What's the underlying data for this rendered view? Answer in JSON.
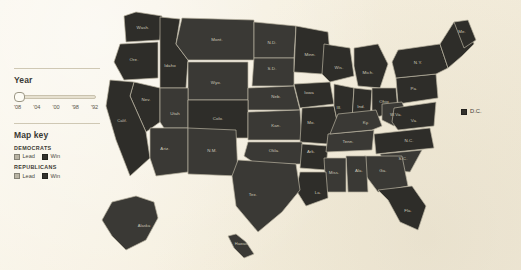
{
  "colors": {
    "background": "#f7f2e4",
    "map_fill": "#3a3935",
    "map_fill_win": "#2e2d29",
    "map_fill_lead": "#4b4943",
    "state_border": "#b9b3a1",
    "state_label": "#cdc8b8",
    "swatch_lead": "#b9b4a4",
    "swatch_win": "#33322d"
  },
  "controls": {
    "year": {
      "title": "Year",
      "ticks": [
        "'08",
        "'04",
        "'00",
        "'98",
        "'92"
      ],
      "selected": "'08",
      "thumb_position_pct": 0
    }
  },
  "map_key": {
    "title": "Map key",
    "groups": [
      {
        "heading": "DEMOCRATS",
        "items": [
          {
            "label": "Lead",
            "swatch": "lead"
          },
          {
            "label": "Win",
            "swatch": "win"
          }
        ]
      },
      {
        "heading": "REPUBLICANS",
        "items": [
          {
            "label": "Lead",
            "swatch": "lead"
          },
          {
            "label": "Win",
            "swatch": "win"
          }
        ]
      }
    ]
  },
  "map": {
    "dc_marker": {
      "label": "D.C."
    },
    "states": [
      {
        "abbr": "Wash.",
        "x": 47,
        "y": 29
      },
      {
        "abbr": "Ore.",
        "x": 38,
        "y": 61
      },
      {
        "abbr": "Idaho",
        "x": 74,
        "y": 67
      },
      {
        "abbr": "Mont.",
        "x": 121,
        "y": 41
      },
      {
        "abbr": "Wyo.",
        "x": 120,
        "y": 84
      },
      {
        "abbr": "N.D.",
        "x": 176,
        "y": 44
      },
      {
        "abbr": "S.D.",
        "x": 176,
        "y": 70
      },
      {
        "abbr": "Neb.",
        "x": 180,
        "y": 98
      },
      {
        "abbr": "Minn.",
        "x": 214,
        "y": 56
      },
      {
        "abbr": "Iowa",
        "x": 213,
        "y": 94
      },
      {
        "abbr": "Wis.",
        "x": 243,
        "y": 69
      },
      {
        "abbr": "Mich.",
        "x": 272,
        "y": 74
      },
      {
        "abbr": "Nev.",
        "x": 50,
        "y": 101
      },
      {
        "abbr": "Calif.",
        "x": 26,
        "y": 122
      },
      {
        "abbr": "Utah",
        "x": 79,
        "y": 115
      },
      {
        "abbr": "Colo.",
        "x": 122,
        "y": 120
      },
      {
        "abbr": "Kan.",
        "x": 180,
        "y": 127
      },
      {
        "abbr": "Mo.",
        "x": 215,
        "y": 124
      },
      {
        "abbr": "Ill.",
        "x": 243,
        "y": 109
      },
      {
        "abbr": "Ind.",
        "x": 265,
        "y": 108
      },
      {
        "abbr": "Ohio",
        "x": 288,
        "y": 103
      },
      {
        "abbr": "Pa.",
        "x": 318,
        "y": 90
      },
      {
        "abbr": "N.Y.",
        "x": 322,
        "y": 64
      },
      {
        "abbr": "Me.",
        "x": 366,
        "y": 33
      },
      {
        "abbr": "Ariz.",
        "x": 69,
        "y": 150
      },
      {
        "abbr": "N.M.",
        "x": 116,
        "y": 152
      },
      {
        "abbr": "Okla.",
        "x": 178,
        "y": 152
      },
      {
        "abbr": "Ark.",
        "x": 215,
        "y": 153
      },
      {
        "abbr": "Tenn.",
        "x": 252,
        "y": 143
      },
      {
        "abbr": "Ky.",
        "x": 270,
        "y": 124
      },
      {
        "abbr": "W.Va.",
        "x": 300,
        "y": 116
      },
      {
        "abbr": "Va.",
        "x": 318,
        "y": 122
      },
      {
        "abbr": "N.C.",
        "x": 313,
        "y": 142
      },
      {
        "abbr": "S.C.",
        "x": 307,
        "y": 160
      },
      {
        "abbr": "Ga.",
        "x": 287,
        "y": 172
      },
      {
        "abbr": "Ala.",
        "x": 263,
        "y": 172
      },
      {
        "abbr": "Miss.",
        "x": 238,
        "y": 174
      },
      {
        "abbr": "La.",
        "x": 222,
        "y": 194
      },
      {
        "abbr": "Tex.",
        "x": 157,
        "y": 196
      },
      {
        "abbr": "Fla.",
        "x": 312,
        "y": 212
      },
      {
        "abbr": "Alaska",
        "x": 48,
        "y": 227
      },
      {
        "abbr": "Hawaii",
        "x": 145,
        "y": 245
      }
    ]
  }
}
